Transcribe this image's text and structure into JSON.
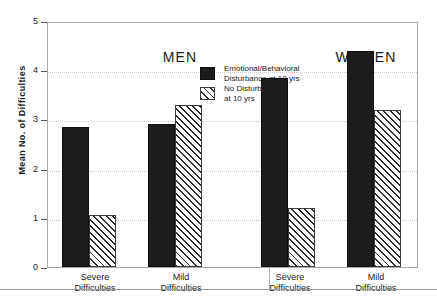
{
  "chart_data": {
    "type": "bar",
    "title": "",
    "xlabel": "",
    "ylabel": "Mean No. of Difficulties",
    "ylim": [
      0,
      5
    ],
    "ytick_labels": [
      "0",
      "1",
      "2",
      "3",
      "4",
      "5"
    ],
    "ytick_values": [
      0,
      1,
      2,
      3,
      4,
      5
    ],
    "grid": true,
    "grid_axis": "y",
    "legend_position": "top-center",
    "panels": [
      {
        "name": "MEN",
        "categories": [
          "Severe Difficulties",
          "Mild Difficulties"
        ],
        "category_lines": [
          [
            "Severe",
            "Difficulties"
          ],
          [
            "Mild",
            "Difficulties"
          ]
        ],
        "series": [
          {
            "name": "Emotional/Behavioral Disturbance at 10 yrs",
            "values": [
              2.85,
              2.9
            ]
          },
          {
            "name": "No Disturbance at 10 yrs",
            "values": [
              1.05,
              3.3
            ]
          }
        ]
      },
      {
        "name": "WOMEN",
        "categories": [
          "Severe Difficulties",
          "Mild Difficulties"
        ],
        "category_lines": [
          [
            "Severe",
            "Difficulties"
          ],
          [
            "Mild",
            "Difficulties"
          ]
        ],
        "series": [
          {
            "name": "Emotional/Behavioral Disturbance at 10 yrs",
            "values": [
              3.85,
              4.4
            ]
          },
          {
            "name": "No Disturbance at 10 yrs",
            "values": [
              1.2,
              3.2
            ]
          }
        ]
      }
    ],
    "legend": [
      {
        "label_line1": "Emotional/Behavioral",
        "label_line2": "Disturbance at 10 yrs",
        "pattern": "solid",
        "color": "#1c1c1c"
      },
      {
        "label_line1": "No  Disturbance",
        "label_line2": "at 10 yrs",
        "pattern": "hatched",
        "color": "#2b2b2b"
      }
    ]
  },
  "axis": {
    "y_title": "Mean No. of Difficulties",
    "ticks": [
      "5",
      "4",
      "3",
      "2",
      "1",
      "0"
    ]
  },
  "panel_titles": {
    "left": "MEN",
    "right": "WOMEN"
  },
  "categories": {
    "men_severe_line1": "Severe",
    "men_severe_line2": "Difficulties",
    "men_mild_line1": "Mild",
    "men_mild_line2": "Difficulties",
    "women_severe_line1": "Severe",
    "women_severe_line2": "Difficulties",
    "women_mild_line1": "Mild",
    "women_mild_line2": "Difficulties"
  },
  "legend": {
    "item1_line1": "Emotional/Behavioral",
    "item1_line2": "Disturbance at 10 yrs",
    "item2_line1": "No  Disturbance",
    "item2_line2": "at 10 yrs"
  },
  "colors": {
    "solid_fill": "#1c1c1c",
    "hatch_stroke": "#2b2b2b",
    "frame": "#a8a8a8",
    "grid": "#c9c9c9",
    "text": "#1a1a1a"
  }
}
